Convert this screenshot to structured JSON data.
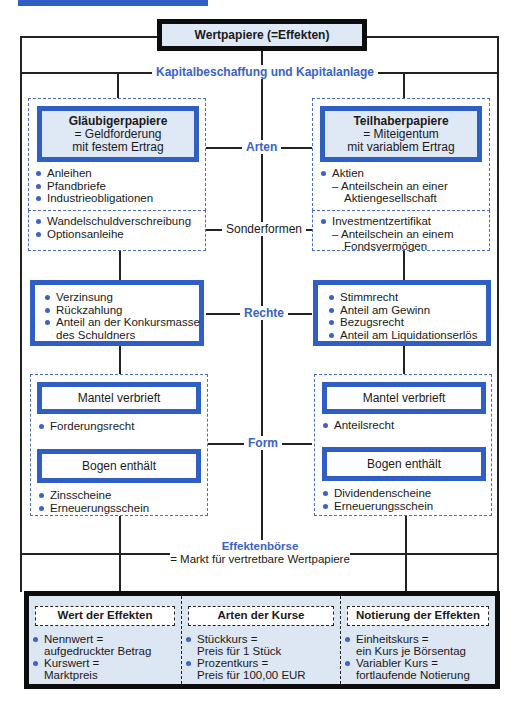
{
  "top": {
    "title": "Wertpapiere  (=Effekten)",
    "subtitle": "Kapitalbeschaffung und Kapitalanlage"
  },
  "center_labels": {
    "arten": "Arten",
    "sonderformen": "Sonderformen",
    "rechte": "Rechte",
    "form": "Form",
    "boerse_title": "Effektenbörse",
    "boerse_desc": "= Markt für vertretbare Wertpapiere"
  },
  "left": {
    "type_title": "Gläubigerpapiere",
    "type_line1": "= Geldforderung",
    "type_line2": "mit festem Ertrag",
    "arten_items": [
      "Anleihen",
      "Pfandbriefe",
      "Industrieobligationen"
    ],
    "sonder_items": [
      "Wandelschuldverschreibung",
      "Optionsanleihe"
    ],
    "rechte_items": [
      "Verzinsung",
      "Rückzahlung",
      "Anteil an der Konkursmasse",
      "des Schuldners"
    ],
    "mantel_label": "Mantel verbrieft",
    "mantel_items": [
      "Forderungsrecht"
    ],
    "bogen_label": "Bogen enthält",
    "bogen_items": [
      "Zinsscheine",
      "Erneuerungsschein"
    ]
  },
  "right": {
    "type_title": "Teilhaberpapiere",
    "type_line1": "= Miteigentum",
    "type_line2": "mit variablem Ertrag",
    "arten_items": [
      "Aktien",
      "– Anteilschein an einer",
      "Aktiengesellschaft"
    ],
    "sonder_items": [
      "Investmentzertifikat",
      "– Anteilschein an einem",
      "Fondsvermögen"
    ],
    "rechte_items": [
      "Stimmrecht",
      "Anteil am Gewinn",
      "Bezugsrecht",
      "Anteil am Liquidationserlös"
    ],
    "mantel_label": "Mantel verbrieft",
    "mantel_items": [
      "Anteilsrecht"
    ],
    "bogen_label": "Bogen enthält",
    "bogen_items": [
      "Dividendenscheine",
      "Erneuerungsschein"
    ]
  },
  "bottom": {
    "columns": [
      {
        "title": "Wert der Effekten",
        "items": [
          "Nennwert =",
          "aufgedruckter Betrag",
          "Kurswert =",
          "Marktpreis"
        ]
      },
      {
        "title": "Arten der Kurse",
        "items": [
          "Stückkurs =",
          "Preis für 1 Stück",
          "Prozentkurs =",
          "Preis für 100,00 EUR"
        ]
      },
      {
        "title": "Notierung der Effekten",
        "items": [
          "Einheitskurs =",
          "ein Kurs je Börsentag",
          "Variabler Kurs =",
          "fortlaufende Notierung"
        ]
      }
    ]
  },
  "colors": {
    "accent_blue": "#2f5fc4",
    "label_blue": "#3a62c8",
    "light_fill": "#dfe8f5",
    "frame": "#0d0d0d"
  }
}
